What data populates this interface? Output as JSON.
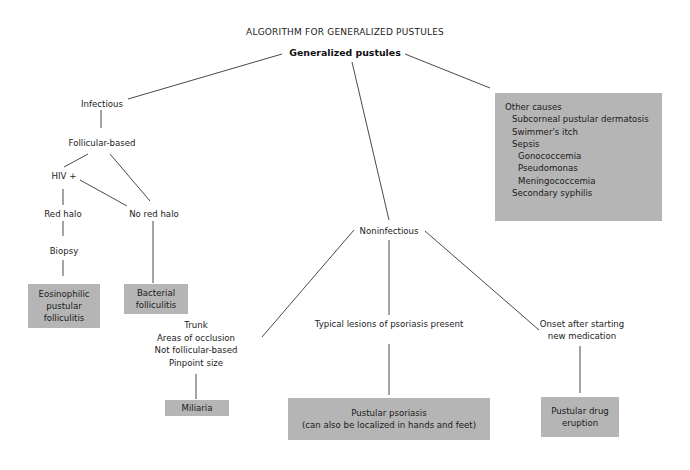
{
  "title": "ALGORITHM FOR GENERALIZED PUSTULES",
  "root": "Generalized pustules",
  "nodes": {
    "infectious": "Infectious",
    "follicular_based": "Follicular-based",
    "hiv_positive": "HIV +",
    "red_halo": "Red halo",
    "no_red_halo": "No red halo",
    "biopsy": "Biopsy",
    "noninfectious": "Noninfectious",
    "miliaria_criteria": [
      "Trunk",
      "Areas of occlusion",
      "Not follicular-based",
      "Pinpoint size"
    ],
    "psoriasis_criteria": "Typical lesions of psoriasis present",
    "drug_criteria": [
      "Onset after starting",
      "new medication"
    ]
  },
  "outcomes": {
    "eosinophilic": [
      "Eosinophilic",
      "pustular",
      "folliculitis"
    ],
    "bacterial": [
      "Bacterial",
      "folliculitis"
    ],
    "miliaria": "Miliaria",
    "pustular_psoriasis": [
      "Pustular psoriasis",
      "(can also be localized in hands and feet)"
    ],
    "pustular_drug": [
      "Pustular drug",
      "eruption"
    ]
  },
  "other_causes": {
    "heading": "Other causes",
    "items": [
      {
        "text": "Subcorneal pustular dermatosis",
        "level": 1
      },
      {
        "text": "Swimmer's itch",
        "level": 1
      },
      {
        "text": "Sepsis",
        "level": 1
      },
      {
        "text": "Gonococcemia",
        "level": 2
      },
      {
        "text": "Pseudomonas",
        "level": 2
      },
      {
        "text": "Meningococcemia",
        "level": 2
      },
      {
        "text": "Secondary syphilis",
        "level": 1
      }
    ]
  },
  "colors": {
    "box_fill": "#b5b5b5",
    "line": "#333333",
    "background": "#ffffff"
  }
}
